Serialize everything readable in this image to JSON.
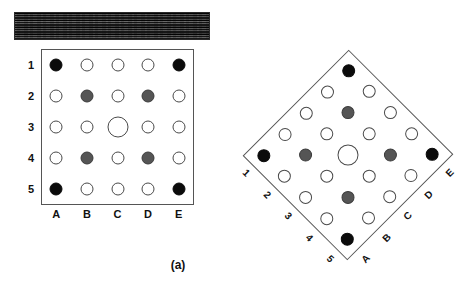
{
  "figure": {
    "panels": [
      {
        "id": "a",
        "caption": "(a)",
        "orientation_deg": 0,
        "texture_bar": {
          "name": "wood-grain-texture-bar",
          "tone": "dark"
        },
        "column_labels": [
          "A",
          "B",
          "C",
          "D",
          "E"
        ],
        "row_labels": [
          "1",
          "2",
          "3",
          "4",
          "5"
        ]
      },
      {
        "id": "b",
        "caption": "(b)",
        "orientation_deg": 45,
        "texture_bar": {
          "name": "wood-grain-texture-bar",
          "tone": "dark"
        },
        "column_labels": [
          "A",
          "B",
          "C",
          "D",
          "E"
        ],
        "row_labels": [
          "1",
          "2",
          "3",
          "4",
          "5"
        ]
      }
    ]
  },
  "colors": {
    "black_fill": "#0b0b0b",
    "grey_fill": "#555555",
    "white_fill": "#ffffff",
    "outline": "#4a4a4a",
    "box_border": "#555555",
    "text": "#111111",
    "background": "#ffffff",
    "texture_dark": "#232323"
  },
  "chart_data": {
    "type": "heatmap",
    "title": "",
    "xlabel": "",
    "ylabel": "",
    "categories": [
      "A",
      "B",
      "C",
      "D",
      "E"
    ],
    "rows": [
      "1",
      "2",
      "3",
      "4",
      "5"
    ],
    "legend": [
      "black = corner marker",
      "grey = intermediate marker",
      "white = open marker",
      "large white = centre marker"
    ],
    "cells": [
      {
        "row": "1",
        "col": "A",
        "fill": "black",
        "size": "normal"
      },
      {
        "row": "1",
        "col": "B",
        "fill": "white",
        "size": "normal"
      },
      {
        "row": "1",
        "col": "C",
        "fill": "white",
        "size": "normal"
      },
      {
        "row": "1",
        "col": "D",
        "fill": "white",
        "size": "normal"
      },
      {
        "row": "1",
        "col": "E",
        "fill": "black",
        "size": "normal"
      },
      {
        "row": "2",
        "col": "A",
        "fill": "white",
        "size": "normal"
      },
      {
        "row": "2",
        "col": "B",
        "fill": "grey",
        "size": "normal"
      },
      {
        "row": "2",
        "col": "C",
        "fill": "white",
        "size": "normal"
      },
      {
        "row": "2",
        "col": "D",
        "fill": "grey",
        "size": "normal"
      },
      {
        "row": "2",
        "col": "E",
        "fill": "white",
        "size": "normal"
      },
      {
        "row": "3",
        "col": "A",
        "fill": "white",
        "size": "normal"
      },
      {
        "row": "3",
        "col": "B",
        "fill": "white",
        "size": "normal"
      },
      {
        "row": "3",
        "col": "C",
        "fill": "white",
        "size": "large"
      },
      {
        "row": "3",
        "col": "D",
        "fill": "white",
        "size": "normal"
      },
      {
        "row": "3",
        "col": "E",
        "fill": "white",
        "size": "normal"
      },
      {
        "row": "4",
        "col": "A",
        "fill": "white",
        "size": "normal"
      },
      {
        "row": "4",
        "col": "B",
        "fill": "grey",
        "size": "normal"
      },
      {
        "row": "4",
        "col": "C",
        "fill": "white",
        "size": "normal"
      },
      {
        "row": "4",
        "col": "D",
        "fill": "grey",
        "size": "normal"
      },
      {
        "row": "4",
        "col": "E",
        "fill": "white",
        "size": "normal"
      },
      {
        "row": "5",
        "col": "A",
        "fill": "black",
        "size": "normal"
      },
      {
        "row": "5",
        "col": "B",
        "fill": "white",
        "size": "normal"
      },
      {
        "row": "5",
        "col": "C",
        "fill": "white",
        "size": "normal"
      },
      {
        "row": "5",
        "col": "D",
        "fill": "white",
        "size": "normal"
      },
      {
        "row": "5",
        "col": "E",
        "fill": "black",
        "size": "normal"
      }
    ]
  }
}
